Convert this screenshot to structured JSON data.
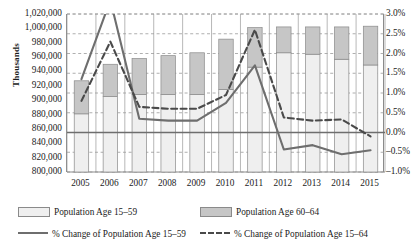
{
  "chart_data": {
    "type": "bar",
    "subtype": "stacked-bar-with-lines",
    "title": "",
    "xlabel": "",
    "ylabel": "Thousands",
    "y2label": "",
    "grid": true,
    "legend_position": "bottom",
    "categories": [
      "2005",
      "2006",
      "2007",
      "2008",
      "2009",
      "2010",
      "2011",
      "2012",
      "2013",
      "2014",
      "2015"
    ],
    "ylim": [
      800000,
      1020000
    ],
    "ytick_step": 20000,
    "yticks": [
      "1,020,000",
      "1,000,000",
      "980,000",
      "960,000",
      "940,000",
      "920,000",
      "900,000",
      "880,000",
      "860,000",
      "840,000",
      "820,000",
      "800,000"
    ],
    "ylim_right": [
      -1.0,
      3.0
    ],
    "ytick_step_right": 0.5,
    "yticks_right": [
      "3.0%",
      "2.5%",
      "2.0%",
      "1.5%",
      "1.0%",
      "0.5%",
      "0.0%",
      "-0.5%",
      "-1.0%"
    ],
    "series": [
      {
        "name": "Population Age 15-59",
        "type": "bar",
        "axis": "left",
        "color": "#efefef",
        "values": [
          881000,
          905000,
          908000,
          908000,
          908000,
          915000,
          946000,
          966000,
          964000,
          957000,
          949000
        ]
      },
      {
        "name": "Population Age 60-64",
        "type": "bar",
        "axis": "left",
        "color": "#c6c6c6",
        "values": [
          46000,
          45000,
          50000,
          54000,
          58000,
          70000,
          55000,
          36000,
          38000,
          45000,
          54000
        ]
      },
      {
        "name": "% Change of Population Age 15-59",
        "type": "line",
        "style": "solid",
        "axis": "right",
        "color": "#6e6e6e",
        "values": [
          1.35,
          3.35,
          0.35,
          0.3,
          0.3,
          0.75,
          1.7,
          -0.43,
          -0.32,
          -0.55,
          -0.45
        ]
      },
      {
        "name": "% Change of Population Age 15-64",
        "type": "line",
        "style": "dashed",
        "axis": "right",
        "color": "#4a4a4a",
        "values": [
          0.8,
          2.3,
          0.65,
          0.6,
          0.6,
          0.95,
          2.6,
          0.38,
          0.3,
          0.33,
          -0.1
        ]
      }
    ]
  },
  "legend": {
    "items": [
      {
        "label": "Population Age 15–59",
        "marker": "swatch-light"
      },
      {
        "label": "Population Age 60–64",
        "marker": "swatch-dark"
      },
      {
        "label": "% Change of Population Age 15–59",
        "marker": "line-solid"
      },
      {
        "label": "% Change of Population Age 15–64",
        "marker": "line-dashed"
      }
    ]
  },
  "colors": {
    "bar_light": "#efefef",
    "bar_dark": "#c6c6c6",
    "line_solid": "#6e6e6e",
    "line_dashed": "#4a4a4a",
    "grid": "#9a9a9a",
    "axis": "#8a8a8a",
    "text": "#1a1a1a"
  }
}
